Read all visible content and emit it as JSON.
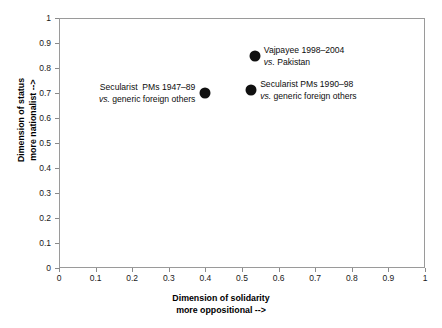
{
  "chart_data": {
    "type": "scatter",
    "title": "",
    "xlabel": "Dimension of solidarity\nmore oppositional -->",
    "ylabel": "Dimension of status\nmore nationalist -->",
    "xlim": [
      0,
      1
    ],
    "ylim": [
      0,
      1
    ],
    "grid": false,
    "legend": "none",
    "x_ticks": [
      "0",
      "0.1",
      "0.2",
      "0.3",
      "0.4",
      "0.5",
      "0.6",
      "0.7",
      "0.8",
      "0.9",
      "1"
    ],
    "y_ticks": [
      "0",
      "0.1",
      "0.2",
      "0.3",
      "0.4",
      "0.5",
      "0.6",
      "0.7",
      "0.8",
      "0.9",
      "1"
    ],
    "x_tick_values": [
      0,
      0.1,
      0.2,
      0.3,
      0.4,
      0.5,
      0.6,
      0.7,
      0.8,
      0.9,
      1
    ],
    "y_tick_values": [
      0,
      0.1,
      0.2,
      0.3,
      0.4,
      0.5,
      0.6,
      0.7,
      0.8,
      0.9,
      1
    ],
    "marker_color": "#101010",
    "points": [
      {
        "x": 0.535,
        "y": 0.848,
        "label_line1": "Vajpayee 1998–2004",
        "label_line2": "vs. Pakistan",
        "label_line2_italic_prefix": "vs.",
        "label_side": "right"
      },
      {
        "x": 0.4,
        "y": 0.7,
        "label_line1": "Secularist  PMs 1947–89",
        "label_line2": "vs. generic foreign others",
        "label_line2_italic_prefix": "vs.",
        "label_side": "left"
      },
      {
        "x": 0.525,
        "y": 0.712,
        "label_line1": "Secularist PMs 1990–98",
        "label_line2": "vs. generic foreign others",
        "label_line2_italic_prefix": "vs.",
        "label_side": "right"
      }
    ]
  },
  "axis_titles": {
    "x_line1": "Dimension of solidarity",
    "x_line2": "more oppositional -->",
    "y_line1": "Dimension of status",
    "y_line2": "more nationalist -->"
  },
  "colors": {
    "marker": "#101010",
    "axis": "#9a9a9a",
    "tick": "#8a8a8a",
    "text": "#0d0d0d",
    "background": "#ffffff"
  }
}
